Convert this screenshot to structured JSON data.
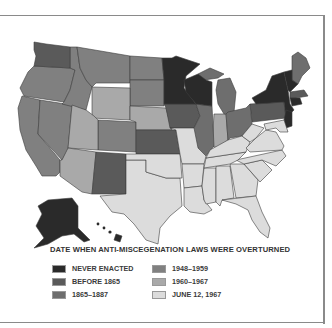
{
  "legend": {
    "title": "DATE WHEN ANTI-MISCEGENATION LAWS WERE OVERTURNED",
    "items": [
      {
        "label": "NEVER ENACTED",
        "color": "#2a2a2a"
      },
      {
        "label": "BEFORE 1865",
        "color": "#5a5a5a"
      },
      {
        "label": "1865–1887",
        "color": "#6e6e6e"
      },
      {
        "label": "1948–1959",
        "color": "#808080"
      },
      {
        "label": "1960–1967",
        "color": "#a9a9a9"
      },
      {
        "label": "JUNE 12, 1967",
        "color": "#dcdcdc"
      }
    ]
  },
  "map": {
    "subject": "United States map by state",
    "categories": {
      "never_enacted": [
        "Minnesota",
        "Wisconsin",
        "New York",
        "Vermont",
        "New Hampshire",
        "New Jersey",
        "Connecticut",
        "Alaska",
        "Hawaii"
      ],
      "before_1865": [
        "Washington",
        "Iowa",
        "Kansas",
        "New Mexico",
        "Massachusetts",
        "Rhode Island",
        "Pennsylvania"
      ],
      "1865_1887": [
        "Illinois",
        "Michigan",
        "Ohio",
        "Maine"
      ],
      "1948_1959": [
        "California",
        "Oregon",
        "Idaho",
        "Montana",
        "Nevada",
        "Colorado",
        "North Dakota",
        "South Dakota"
      ],
      "1960_1967": [
        "Arizona",
        "Utah",
        "Wyoming",
        "Nebraska",
        "Indiana"
      ],
      "june_12_1967": [
        "Texas",
        "Oklahoma",
        "Missouri",
        "Arkansas",
        "Louisiana",
        "Mississippi",
        "Alabama",
        "Georgia",
        "Florida",
        "Tennessee",
        "Kentucky",
        "South Carolina",
        "North Carolina",
        "Virginia",
        "West Virginia",
        "Maryland",
        "Delaware"
      ]
    }
  }
}
